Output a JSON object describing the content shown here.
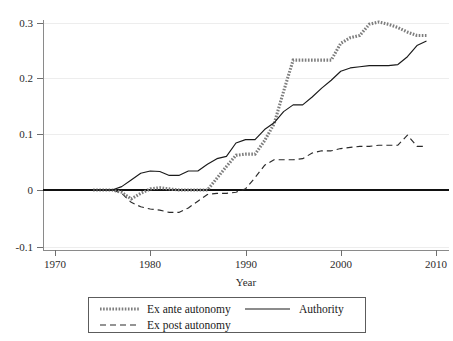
{
  "chart_data": {
    "type": "line",
    "title": "",
    "xlabel": "Year",
    "ylabel": "",
    "xlim": [
      1968.5,
      2011.5
    ],
    "ylim": [
      -0.115,
      0.325
    ],
    "xticks": [
      1970,
      1980,
      1990,
      2000,
      2010
    ],
    "xtick_labels": [
      "1970",
      "1980",
      "1990",
      "2000",
      "2010"
    ],
    "yticks": [
      -0.1,
      0,
      0.1,
      0.2,
      0.3
    ],
    "ytick_labels": [
      "-0.1",
      "0",
      "0.1",
      "0.2",
      "0.3"
    ],
    "grid": "horizontal",
    "legend_position": "below-center",
    "zero_reference_line": 0,
    "series": [
      {
        "name": "Ex ante autonomy",
        "style": "dotted",
        "color": "#7d7d7d",
        "x": [
          1974,
          1975,
          1976,
          1977,
          1978,
          1979,
          1980,
          1981,
          1982,
          1983,
          1984,
          1985,
          1986,
          1987,
          1988,
          1989,
          1990,
          1991,
          1992,
          1993,
          1994,
          1995,
          1996,
          1997,
          1998,
          1999,
          2000,
          2001,
          2002,
          2003,
          2004,
          2005,
          2006,
          2007,
          2008,
          2009
        ],
        "values": [
          0.0,
          0.0,
          0.0,
          -0.004,
          -0.016,
          -0.006,
          0.002,
          0.004,
          0.002,
          0.0,
          0.0,
          0.0,
          0.0,
          0.021,
          0.042,
          0.062,
          0.064,
          0.064,
          0.088,
          0.118,
          0.176,
          0.232,
          0.232,
          0.232,
          0.232,
          0.232,
          0.262,
          0.272,
          0.276,
          0.296,
          0.3,
          0.296,
          0.29,
          0.282,
          0.276,
          0.276
        ]
      },
      {
        "name": "Authority",
        "style": "solid",
        "color": "#1a1a1a",
        "x": [
          1974,
          1975,
          1976,
          1977,
          1978,
          1979,
          1980,
          1981,
          1982,
          1983,
          1984,
          1985,
          1986,
          1987,
          1988,
          1989,
          1990,
          1991,
          1992,
          1993,
          1994,
          1995,
          1996,
          1997,
          1998,
          1999,
          2000,
          2001,
          2002,
          2003,
          2004,
          2005,
          2006,
          2007,
          2008,
          2009
        ],
        "values": [
          0.0,
          0.0,
          0.0,
          0.006,
          0.018,
          0.03,
          0.034,
          0.033,
          0.026,
          0.026,
          0.034,
          0.034,
          0.046,
          0.056,
          0.06,
          0.084,
          0.09,
          0.09,
          0.108,
          0.12,
          0.14,
          0.152,
          0.152,
          0.166,
          0.182,
          0.196,
          0.212,
          0.218,
          0.22,
          0.222,
          0.222,
          0.222,
          0.224,
          0.238,
          0.258,
          0.266
        ]
      },
      {
        "name": "Ex post autonomy",
        "style": "dashed",
        "color": "#2a2a2a",
        "x": [
          1974,
          1975,
          1976,
          1977,
          1978,
          1979,
          1980,
          1981,
          1982,
          1983,
          1984,
          1985,
          1986,
          1987,
          1988,
          1989,
          1990,
          1991,
          1992,
          1993,
          1994,
          1995,
          1996,
          1997,
          1998,
          1999,
          2000,
          2001,
          2002,
          2003,
          2004,
          2005,
          2006,
          2007,
          2008,
          2009
        ],
        "values": [
          0.0,
          0.0,
          0.0,
          -0.006,
          -0.022,
          -0.03,
          -0.034,
          -0.036,
          -0.04,
          -0.04,
          -0.032,
          -0.02,
          -0.008,
          -0.006,
          -0.006,
          -0.004,
          0.002,
          0.022,
          0.044,
          0.054,
          0.054,
          0.054,
          0.056,
          0.066,
          0.07,
          0.07,
          0.074,
          0.076,
          0.078,
          0.078,
          0.08,
          0.08,
          0.08,
          0.098,
          0.078,
          0.078
        ]
      }
    ],
    "legend": [
      {
        "label": "Ex ante autonomy",
        "style": "dotted"
      },
      {
        "label": "Authority",
        "style": "solid"
      },
      {
        "label": "Ex post autonomy",
        "style": "dashed"
      }
    ]
  }
}
